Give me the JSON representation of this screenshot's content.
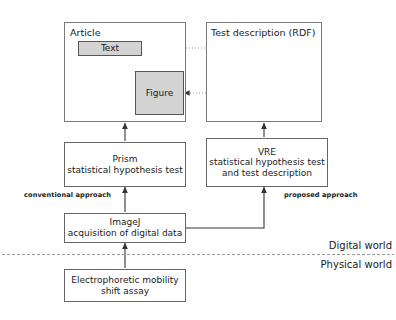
{
  "diagram": {
    "title_article": "Article",
    "title_rdf": "Test description (RDF)",
    "article_text_box": "Text",
    "article_figure_box": "Figure",
    "prism_box": "Prism\nstatistical hypothesis test",
    "vre_box": "VRE\nstatistical hypothesis test\nand test description",
    "imagej_box": "ImageJ\nacquisition of digital data",
    "assay_box": "Electrophoretic mobility\nshift assay",
    "label_conventional": "conventional approach",
    "label_proposed": "proposed approach",
    "label_digital_world": "Digital world",
    "label_physical_world": "Physical world",
    "rdf_nodes": [
      {
        "id": "node-top",
        "cx": 264,
        "cy": 54,
        "r": 11
      },
      {
        "id": "node-left",
        "cx": 236,
        "cy": 93,
        "r": 11
      },
      {
        "id": "node-right",
        "cx": 296,
        "cy": 93,
        "r": 11
      }
    ],
    "colors": {
      "shaded_fill": "#d3d3d3",
      "node_fill": "#d3d3d3",
      "stroke": "#444444",
      "container_stroke": "#7a7a7a",
      "dotted_stroke": "#8a8a8a",
      "background": "#ffffff"
    }
  }
}
